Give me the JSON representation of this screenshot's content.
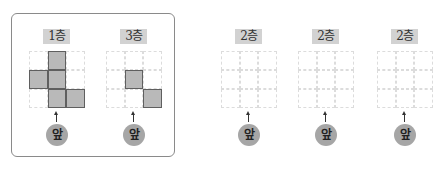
{
  "colors": {
    "filled_cell": "#b9b9b9",
    "cell_border": "#5f5f5f",
    "grid_line": "#dcdcdc",
    "label_bg": "#d2d2d2",
    "front_circle": "#a6a6a6",
    "frame_border": "#8a8a8a"
  },
  "front_label": "앞",
  "panels": [
    {
      "label": "1층",
      "x": 28,
      "filled": [
        [
          0,
          1
        ],
        [
          1,
          0
        ],
        [
          1,
          1
        ],
        [
          2,
          1
        ],
        [
          2,
          2
        ]
      ]
    },
    {
      "label": "3층",
      "x": 105,
      "filled": [
        [
          1,
          1
        ],
        [
          2,
          2
        ]
      ]
    },
    {
      "label": "2층",
      "x": 220,
      "filled": []
    },
    {
      "label": "2층",
      "x": 297,
      "filled": []
    },
    {
      "label": "2층",
      "x": 376,
      "filled": []
    }
  ]
}
